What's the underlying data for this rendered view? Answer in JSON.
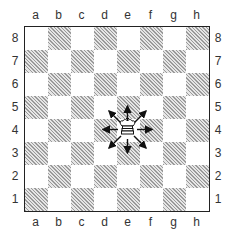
{
  "diagram": {
    "title": "",
    "files": [
      "a",
      "b",
      "c",
      "d",
      "e",
      "f",
      "g",
      "h"
    ],
    "ranks": [
      "8",
      "7",
      "6",
      "5",
      "4",
      "3",
      "2",
      "1"
    ],
    "dark_square_style": "hatched",
    "pieces": [
      {
        "piece": "king",
        "color": "white",
        "square": "e4",
        "icon": "white-king-icon"
      }
    ],
    "arrows": [
      {
        "from": "e4",
        "to": "e5",
        "direction": "up"
      },
      {
        "from": "e4",
        "to": "f5",
        "direction": "up-right"
      },
      {
        "from": "e4",
        "to": "f4",
        "direction": "right"
      },
      {
        "from": "e4",
        "to": "f3",
        "direction": "down-right"
      },
      {
        "from": "e4",
        "to": "e3",
        "direction": "down"
      },
      {
        "from": "e4",
        "to": "d3",
        "direction": "down-left"
      },
      {
        "from": "e4",
        "to": "d4",
        "direction": "left"
      },
      {
        "from": "e4",
        "to": "d5",
        "direction": "up-left"
      }
    ],
    "colors": {
      "border": "#222222",
      "hatch": "#9a9a9a",
      "light": "#ffffff"
    }
  }
}
